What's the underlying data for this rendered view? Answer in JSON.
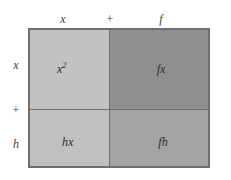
{
  "figure": {
    "colors": {
      "background": "#ffffff",
      "border": "#6f6f6f",
      "divider": "#6e6e6e",
      "cell_x2": "#c2c2c2",
      "cell_fx": "#8f8f8f",
      "cell_hx": "#c0c0c0",
      "cell_fh": "#a3a3a3",
      "label_text": "#2e2e2e",
      "axis_text": "#3a3a3a"
    }
  },
  "top_axis": {
    "terms": [
      {
        "label": "x"
      },
      {
        "label": "+"
      },
      {
        "label": "f"
      }
    ]
  },
  "left_axis": {
    "terms": [
      {
        "label": "x"
      },
      {
        "label": "+"
      },
      {
        "label": "h"
      }
    ]
  },
  "grid": {
    "cells": [
      {
        "name": "x-squared",
        "base": "x",
        "exponent": "2",
        "row": "x",
        "column": "x"
      },
      {
        "name": "f-times-x",
        "base": "fx",
        "exponent": "",
        "row": "x",
        "column": "f"
      },
      {
        "name": "h-times-x",
        "base": "hx",
        "exponent": "",
        "row": "h",
        "column": "x"
      },
      {
        "name": "f-times-h",
        "base": "fh",
        "exponent": "",
        "row": "h",
        "column": "f"
      }
    ]
  }
}
